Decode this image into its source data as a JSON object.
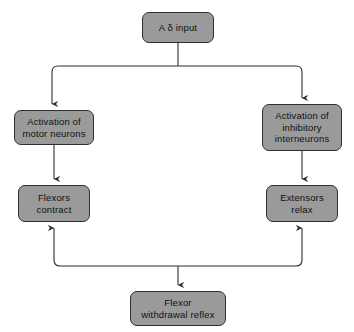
{
  "diagram": {
    "type": "flowchart",
    "background_color": "#ffffff",
    "node_fill_color": "#9a9a9a",
    "node_border_color": "#2e2e2e",
    "connector_color": "#2e2e2e",
    "nodes": [
      {
        "id": "input",
        "label": "A δ input"
      },
      {
        "id": "motor",
        "label": "Activation of\nmotor neurons"
      },
      {
        "id": "inhibitory",
        "label": "Activation of\ninhibitory\ninterneurons"
      },
      {
        "id": "flexors",
        "label": "Flexors\ncontract"
      },
      {
        "id": "extensors",
        "label": "Extensors\nrelax"
      },
      {
        "id": "reflex",
        "label": "Flexor\nwithdrawal reflex"
      }
    ],
    "edges": [
      {
        "from": "input",
        "to": "motor",
        "direction": "down"
      },
      {
        "from": "input",
        "to": "inhibitory",
        "direction": "down"
      },
      {
        "from": "motor",
        "to": "flexors",
        "direction": "down"
      },
      {
        "from": "inhibitory",
        "to": "extensors",
        "direction": "down"
      },
      {
        "from": "flexors",
        "to": "reflex",
        "direction": "down"
      },
      {
        "from": "extensors",
        "to": "reflex",
        "direction": "down"
      },
      {
        "from": "reflex",
        "to": "flexors",
        "direction": "up"
      },
      {
        "from": "reflex",
        "to": "extensors",
        "direction": "up"
      }
    ]
  }
}
